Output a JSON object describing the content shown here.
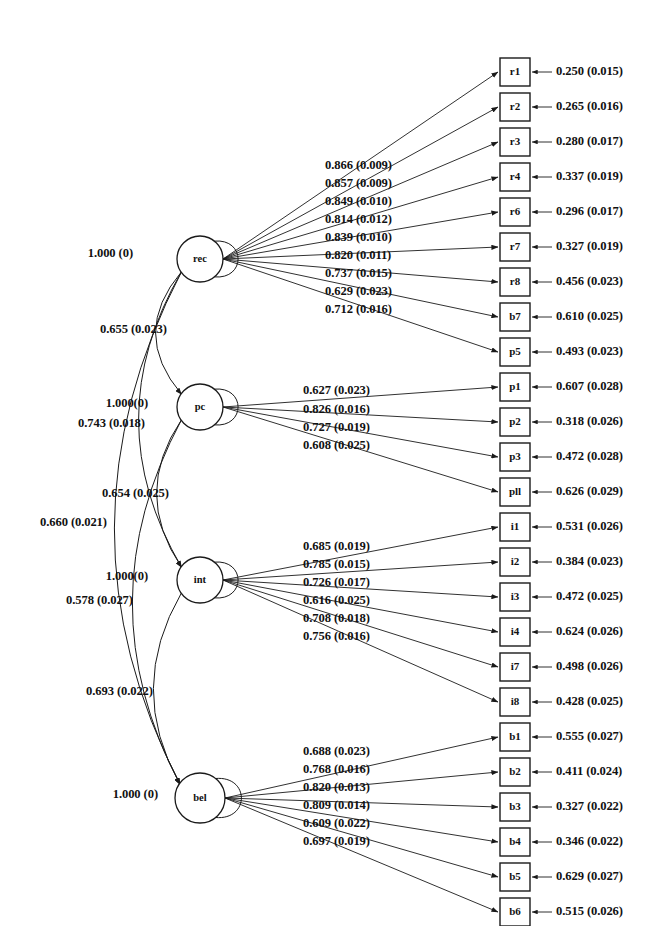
{
  "figure": {
    "type": "sem-path-diagram",
    "title": "",
    "variance_se_zero_label": "1.000 (0)",
    "variance_se_zero_label_compact": "1.000(0)"
  },
  "latent_factors": [
    {
      "id": "rec",
      "label": "rec",
      "cx": 200,
      "cy": 259,
      "r": 23,
      "variance": "1.000 (0)"
    },
    {
      "id": "pc",
      "label": "pc",
      "cx": 200,
      "cy": 407,
      "r": 23,
      "variance": "1.000(0)"
    },
    {
      "id": "int",
      "label": "int",
      "cx": 200,
      "cy": 580,
      "r": 23,
      "variance": "1.000(0)"
    },
    {
      "id": "bel",
      "label": "bel",
      "cx": 200,
      "cy": 798,
      "r": 25,
      "variance": "1.000 (0)"
    }
  ],
  "indicators": [
    {
      "id": "r1",
      "label": "r1",
      "factor": "rec",
      "loading": "0.866 (0.009)",
      "residual": "0.250 (0.015)",
      "y": 72
    },
    {
      "id": "r2",
      "label": "r2",
      "factor": "rec",
      "loading": "0.857 (0.009)",
      "residual": "0.265 (0.016)",
      "y": 107
    },
    {
      "id": "r3",
      "label": "r3",
      "factor": "rec",
      "loading": "0.849 (0.010)",
      "residual": "0.280 (0.017)",
      "y": 142
    },
    {
      "id": "r4",
      "label": "r4",
      "factor": "rec",
      "loading": "0.814 (0.012)",
      "residual": "0.337 (0.019)",
      "y": 177
    },
    {
      "id": "r6",
      "label": "r6",
      "factor": "rec",
      "loading": "0.839 (0.010)",
      "residual": "0.296 (0.017)",
      "y": 212
    },
    {
      "id": "r7",
      "label": "r7",
      "factor": "rec",
      "loading": "0.820 (0.011)",
      "residual": "0.327 (0.019)",
      "y": 247
    },
    {
      "id": "r8",
      "label": "r8",
      "factor": "rec",
      "loading": "0.737 (0.015)",
      "residual": "0.456 (0.023)",
      "y": 282
    },
    {
      "id": "b7",
      "label": "b7",
      "factor": "rec",
      "loading": "0.629 (0.023)",
      "residual": "0.610 (0.025)",
      "y": 317
    },
    {
      "id": "p5",
      "label": "p5",
      "factor": "rec",
      "loading": "0.712 (0.016)",
      "residual": "0.493 (0.023)",
      "y": 352
    },
    {
      "id": "p1",
      "label": "p1",
      "factor": "pc",
      "loading": "0.627 (0.023)",
      "residual": "0.607 (0.028)",
      "y": 387
    },
    {
      "id": "p2",
      "label": "p2",
      "factor": "pc",
      "loading": "0.826 (0.016)",
      "residual": "0.318 (0.026)",
      "y": 422
    },
    {
      "id": "p3",
      "label": "p3",
      "factor": "pc",
      "loading": "0.727 (0.019)",
      "residual": "0.472 (0.028)",
      "y": 457
    },
    {
      "id": "p11",
      "label": "pll",
      "factor": "pc",
      "loading": "0.608 (0.025)",
      "residual": "0.626 (0.029)",
      "y": 492
    },
    {
      "id": "i1",
      "label": "i1",
      "factor": "int",
      "loading": "0.685 (0.019)",
      "residual": "0.531 (0.026)",
      "y": 527
    },
    {
      "id": "i2",
      "label": "i2",
      "factor": "int",
      "loading": "0.785 (0.015)",
      "residual": "0.384 (0.023)",
      "y": 562
    },
    {
      "id": "i3",
      "label": "i3",
      "factor": "int",
      "loading": "0.726 (0.017)",
      "residual": "0.472 (0.025)",
      "y": 597
    },
    {
      "id": "i4",
      "label": "i4",
      "factor": "int",
      "loading": "0.616 (0.025)",
      "residual": "0.624 (0.026)",
      "y": 632
    },
    {
      "id": "i7",
      "label": "i7",
      "factor": "int",
      "loading": "0.708 (0.018)",
      "residual": "0.498 (0.026)",
      "y": 667
    },
    {
      "id": "i8",
      "label": "i8",
      "factor": "int",
      "loading": "0.756 (0.016)",
      "residual": "0.428 (0.025)",
      "y": 702
    },
    {
      "id": "b1",
      "label": "b1",
      "factor": "bel",
      "loading": "0.688 (0.023)",
      "residual": "0.555 (0.027)",
      "y": 737
    },
    {
      "id": "b2",
      "label": "b2",
      "factor": "bel",
      "loading": "0.768 (0.016)",
      "residual": "0.411 (0.024)",
      "y": 772
    },
    {
      "id": "b3",
      "label": "b3",
      "factor": "bel",
      "loading": "0.820 (0.013)",
      "residual": "0.327 (0.022)",
      "y": 807
    },
    {
      "id": "b4",
      "label": "b4",
      "factor": "bel",
      "loading": "0.809 (0.014)",
      "residual": "0.346 (0.022)",
      "y": 842
    },
    {
      "id": "b5",
      "label": "b5",
      "factor": "bel",
      "loading": "0.609 (0.022)",
      "residual": "0.629 (0.027)",
      "y": 877
    },
    {
      "id": "b6",
      "label": "b6",
      "factor": "bel",
      "loading": "0.697 (0.019)",
      "residual": "0.515 (0.026)",
      "y": 912
    }
  ],
  "loading_label_blocks": [
    {
      "factor": "rec",
      "x": 325,
      "values": [
        {
          "text": "0.866 (0.009)",
          "y": 166
        },
        {
          "text": "0.857 (0.009)",
          "y": 184
        },
        {
          "text": "0.849 (0.010)",
          "y": 202
        },
        {
          "text": "0.814 (0.012)",
          "y": 220
        },
        {
          "text": "0.839 (0.010)",
          "y": 238
        },
        {
          "text": "0.820 (0.011)",
          "y": 256
        },
        {
          "text": "0.737 (0.015)",
          "y": 274
        },
        {
          "text": "0.629 (0.023)",
          "y": 292
        },
        {
          "text": "0.712 (0.016)",
          "y": 310
        }
      ]
    },
    {
      "factor": "pc",
      "x": 303,
      "values": [
        {
          "text": "0.627 (0.023)",
          "y": 391
        },
        {
          "text": "0.826 (0.016)",
          "y": 410
        },
        {
          "text": "0.727 (0.019)",
          "y": 428
        },
        {
          "text": "0.608 (0.025)",
          "y": 446
        }
      ]
    },
    {
      "factor": "int",
      "x": 303,
      "values": [
        {
          "text": "0.685 (0.019)",
          "y": 547
        },
        {
          "text": "0.785 (0.015)",
          "y": 565
        },
        {
          "text": "0.726 (0.017)",
          "y": 583
        },
        {
          "text": "0.616 (0.025)",
          "y": 601
        },
        {
          "text": "0.708 (0.018)",
          "y": 619
        },
        {
          "text": "0.756 (0.016)",
          "y": 637
        }
      ]
    },
    {
      "factor": "bel",
      "x": 303,
      "values": [
        {
          "text": "0.688 (0.023)",
          "y": 752
        },
        {
          "text": "0.768 (0.016)",
          "y": 770
        },
        {
          "text": "0.820 (0.013)",
          "y": 788
        },
        {
          "text": "0.809 (0.014)",
          "y": 806
        },
        {
          "text": "0.609 (0.022)",
          "y": 824
        },
        {
          "text": "0.697 (0.019)",
          "y": 842
        }
      ]
    }
  ],
  "covariance_labels": [
    {
      "id": "rec-variance",
      "text": "1.000 (0)",
      "x": 133,
      "y": 254,
      "anchor": "end"
    },
    {
      "id": "cov-rec-pc",
      "text": "0.655 (0.023)",
      "x": 100,
      "y": 330,
      "anchor": "start"
    },
    {
      "id": "pc-variance",
      "text": "1.000(0)",
      "x": 148,
      "y": 404,
      "anchor": "end"
    },
    {
      "id": "cov-rec-int",
      "text": "0.743 (0.018)",
      "x": 78,
      "y": 424,
      "anchor": "start"
    },
    {
      "id": "cov-pc-int",
      "text": "0.654 (0.025)",
      "x": 102,
      "y": 494,
      "anchor": "start"
    },
    {
      "id": "cov-rec-bel",
      "text": "0.660 (0.021)",
      "x": 40,
      "y": 523,
      "anchor": "start"
    },
    {
      "id": "int-variance",
      "text": "1.000(0)",
      "x": 148,
      "y": 577,
      "anchor": "end"
    },
    {
      "id": "cov-pc-bel",
      "text": "0.578 (0.027)",
      "x": 66,
      "y": 601,
      "anchor": "start"
    },
    {
      "id": "cov-int-bel",
      "text": "0.693 (0.022)",
      "x": 86,
      "y": 692,
      "anchor": "start"
    },
    {
      "id": "bel-variance",
      "text": "1.000 (0)",
      "x": 158,
      "y": 795,
      "anchor": "end"
    }
  ],
  "geometry": {
    "box_x": 500,
    "box_w": 30,
    "box_h": 28,
    "residual_text_x": 556,
    "residual_arrow_from_x": 552,
    "residual_arrow_to_x": 532
  }
}
